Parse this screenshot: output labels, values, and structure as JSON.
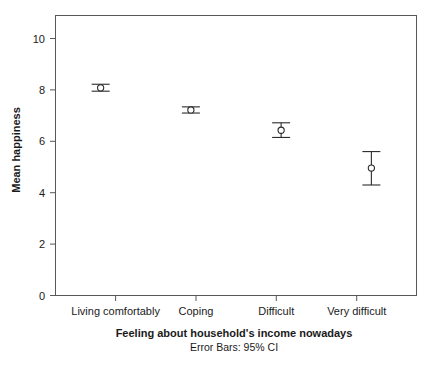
{
  "chart_data": {
    "type": "scatter",
    "title": "",
    "xlabel": "Feeling about household's income nowadays",
    "ylabel": "Mean happiness",
    "caption": "Error Bars: 95% CI",
    "categories": [
      "Living comfortably",
      "Coping",
      "Difficult",
      "Very difficult"
    ],
    "series": [
      {
        "name": "Mean happiness",
        "values": [
          8.08,
          7.22,
          6.43,
          4.96
        ],
        "ci_lower": [
          7.95,
          7.1,
          6.15,
          4.3
        ],
        "ci_upper": [
          8.22,
          7.34,
          6.72,
          5.6
        ]
      }
    ],
    "ylim": [
      0,
      11
    ],
    "yticks": [
      0,
      2,
      4,
      6,
      8,
      10
    ],
    "ytick_labels": [
      "0",
      "2",
      "4",
      "6",
      "8",
      "10"
    ],
    "grid": false,
    "legend": "none",
    "marker_style": "open-circle",
    "error_bar_type": "95% CI"
  },
  "axis": {
    "y_title": "Mean happiness",
    "x_title": "Feeling about household's income nowadays",
    "caption": "Error Bars: 95% CI"
  },
  "ticks": {
    "y": [
      "0",
      "2",
      "4",
      "6",
      "8",
      "10"
    ]
  },
  "categories": {
    "c0": "Living comfortably",
    "c1": "Coping",
    "c2": "Difficult",
    "c3": "Very difficult"
  },
  "colors": {
    "frame": "#585858",
    "marker": "#2b2b2b",
    "text": "#1a1a1a",
    "background": "#ffffff"
  }
}
